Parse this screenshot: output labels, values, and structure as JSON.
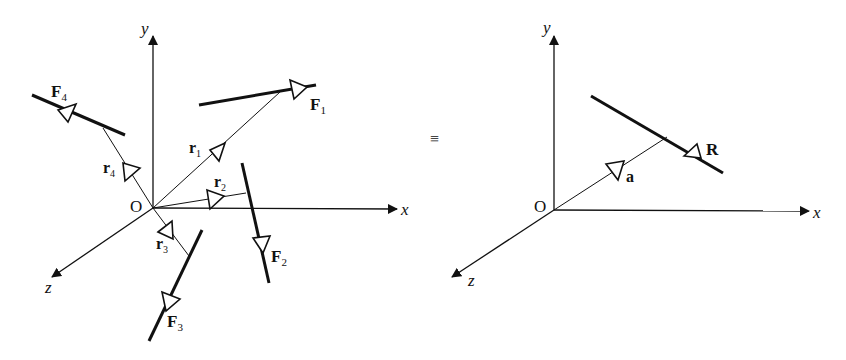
{
  "left_diagram": {
    "origin_label": "O",
    "axes": {
      "x": "x",
      "y": "y",
      "z": "z"
    },
    "forces": [
      {
        "name": "F",
        "sub": "1"
      },
      {
        "name": "F",
        "sub": "2"
      },
      {
        "name": "F",
        "sub": "3"
      },
      {
        "name": "F",
        "sub": "4"
      }
    ],
    "position_vectors": [
      {
        "name": "r",
        "sub": "1"
      },
      {
        "name": "r",
        "sub": "2"
      },
      {
        "name": "r",
        "sub": "3"
      },
      {
        "name": "r",
        "sub": "4"
      }
    ]
  },
  "equivalence_symbol": "≡",
  "right_diagram": {
    "origin_label": "O",
    "axes": {
      "x": "x",
      "y": "y",
      "z": "z"
    },
    "resultant": "R",
    "position_vector": "a"
  }
}
